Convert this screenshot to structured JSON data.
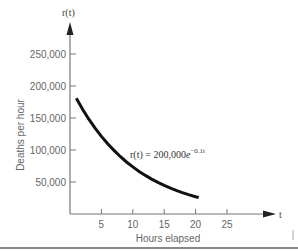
{
  "chart_data": {
    "type": "line",
    "title": "",
    "xlabel": "Hours elapsed",
    "ylabel": "Deaths per hour",
    "x_axis_var": "t",
    "y_axis_var": "r(t)",
    "annotation": {
      "lhs": "r(t) = 200,000",
      "base": "e",
      "exponent": "−0.1t",
      "full_text": "r(t) = 200,000e^(−0.1t)"
    },
    "x_ticks": [
      5,
      10,
      15,
      20,
      25
    ],
    "x_tick_labels": [
      "5",
      "10",
      "15",
      "20",
      "25"
    ],
    "y_ticks": [
      50000,
      100000,
      150000,
      200000,
      250000
    ],
    "y_tick_labels": [
      "50,000",
      "100,000",
      "150,000",
      "200,000",
      "250,000"
    ],
    "xlim": [
      0,
      32
    ],
    "ylim": [
      0,
      290000
    ],
    "grid": false,
    "legend": null,
    "series": [
      {
        "name": "r(t) = 200,000e^(−0.1t)",
        "color": "#111111",
        "x": [
          1,
          2,
          3,
          4,
          5,
          6,
          7,
          8,
          9,
          10,
          11,
          12,
          13,
          14,
          15,
          16,
          17,
          18,
          19,
          20,
          20.5
        ],
        "values": [
          180967,
          163746,
          148164,
          134064,
          121306,
          109762,
          99317,
          89866,
          81314,
          73576,
          66574,
          60239,
          54506,
          49319,
          44626,
          40379,
          36537,
          33059,
          29914,
          27067,
          25747
        ]
      }
    ]
  },
  "colors": {
    "axis": "#777777",
    "curve": "#111111",
    "rule": "#888888"
  }
}
